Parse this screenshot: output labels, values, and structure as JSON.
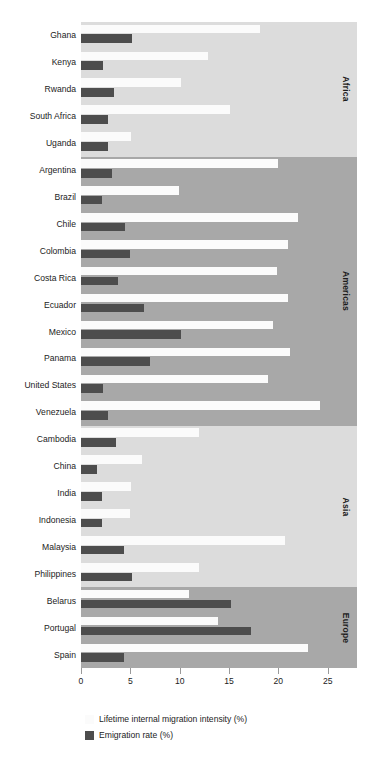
{
  "chart_data": {
    "type": "bar",
    "orientation": "horizontal",
    "title": "",
    "subtitle": "",
    "xlabel": "",
    "ylabel": "",
    "xlim": [
      0,
      26.5
    ],
    "grid": false,
    "legend_position": "bottom-left",
    "xticks": [
      0,
      5,
      10,
      15,
      20,
      25
    ],
    "xtick_labels": [
      "0",
      "5",
      "10",
      "15",
      "20",
      "25"
    ],
    "categories": [
      "Ghana",
      "Kenya",
      "Rwanda",
      "South Africa",
      "Uganda",
      "Argentina",
      "Brazil",
      "Chile",
      "Colombia",
      "Costa Rica",
      "Ecuador",
      "Mexico",
      "Panama",
      "United States",
      "Venezuela",
      "Cambodia",
      "China",
      "India",
      "Indonesia",
      "Malaysia",
      "Philippines",
      "Belarus",
      "Portugal",
      "Spain"
    ],
    "series": [
      {
        "name": "Lifetime internal migration intensity (%)",
        "color": "#fbfbfb",
        "values": [
          18.1,
          12.9,
          10.1,
          15.1,
          5.1,
          20.0,
          9.9,
          22.0,
          21.0,
          19.9,
          21.0,
          19.5,
          21.2,
          19.0,
          24.2,
          12.0,
          6.2,
          5.1,
          5.0,
          20.7,
          12.0,
          10.9,
          13.9,
          23.0
        ]
      },
      {
        "name": "Emigration rate (%)",
        "color": "#4d4d4d",
        "values": [
          5.2,
          2.2,
          3.3,
          2.7,
          2.7,
          3.1,
          2.1,
          4.5,
          5.0,
          3.7,
          6.4,
          10.1,
          7.0,
          2.2,
          2.7,
          3.5,
          1.6,
          2.1,
          2.1,
          4.4,
          5.2,
          15.2,
          17.2,
          4.4
        ]
      }
    ],
    "region_bands": [
      {
        "label": "Africa",
        "start_index": 0,
        "end_index": 4,
        "color": "#dcdcdc"
      },
      {
        "label": "Americas",
        "start_index": 5,
        "end_index": 14,
        "color": "#a8a8a8"
      },
      {
        "label": "Asia",
        "start_index": 15,
        "end_index": 20,
        "color": "#dcdcdc"
      },
      {
        "label": "Europe",
        "start_index": 21,
        "end_index": 23,
        "color": "#a8a8a8"
      }
    ]
  },
  "legend": {
    "items": [
      {
        "label": "Lifetime internal migration intensity (%)",
        "color": "#fbfbfb"
      },
      {
        "label": "Emigration rate (%)",
        "color": "#4d4d4d"
      }
    ]
  }
}
